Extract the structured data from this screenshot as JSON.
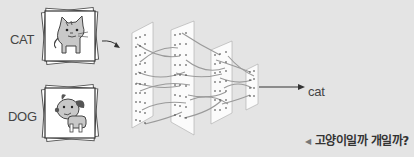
{
  "inputs": [
    {
      "label": "CAT",
      "image": "cat-illustration"
    },
    {
      "label": "DOG",
      "image": "dog-illustration"
    }
  ],
  "network": {
    "layers": 4,
    "output_label": "cat"
  },
  "caption": {
    "marker": "◀",
    "text": "고양이일까 개일까?"
  },
  "colors": {
    "background": "#e4e4e4",
    "panel": "#ffffff",
    "lines": "#9a9a9a",
    "text": "#444444"
  }
}
